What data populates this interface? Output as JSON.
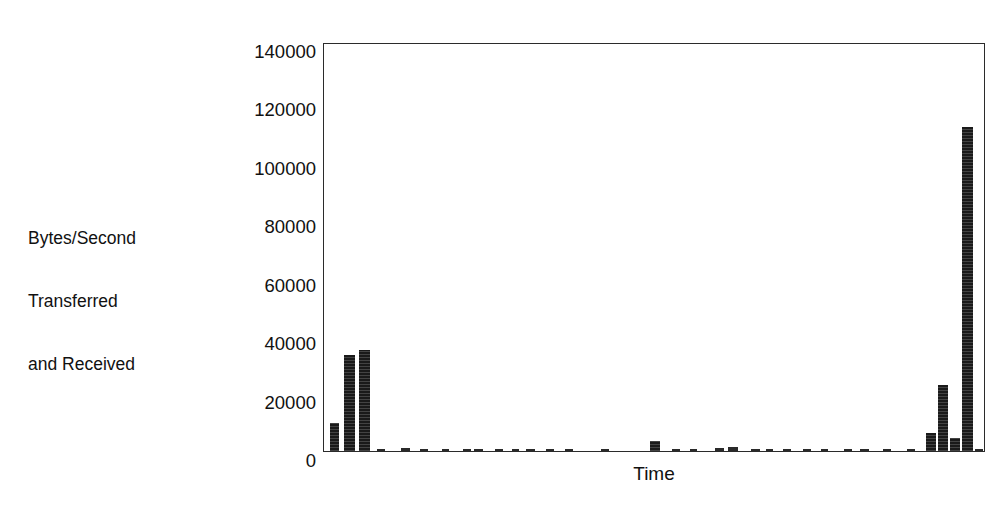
{
  "chart_data": {
    "type": "bar",
    "title": "",
    "subtitle": "",
    "xlabel": "Time",
    "ylabel": "Bytes/Second Transferred and Received",
    "ylabel_lines": [
      "Bytes/Second",
      "Transferred",
      "and Received"
    ],
    "ylim": [
      0,
      140000
    ],
    "xlim": [
      0,
      100
    ],
    "ytick_labels": [
      "0",
      "20000",
      "40000",
      "60000",
      "80000",
      "100000",
      "120000",
      "140000"
    ],
    "ytick_values": [
      0,
      20000,
      40000,
      60000,
      80000,
      100000,
      120000,
      140000
    ],
    "xtick_labels": [],
    "grid": false,
    "legend": false,
    "legend_position": "none",
    "bar_color": "#1a1a1a",
    "axis_color": "#2b2b2b",
    "background_color": "#ffffff",
    "x_unit": "percent-of-axis",
    "categories": [
      "t1",
      "t2",
      "t3",
      "t4",
      "t5",
      "t6",
      "t7",
      "t8",
      "t9",
      "t10",
      "t11",
      "t12",
      "t13",
      "t14",
      "t15",
      "t16",
      "t17",
      "t18",
      "t19",
      "t20",
      "t21",
      "t22",
      "t23",
      "t24",
      "t25",
      "t26",
      "t27",
      "t28",
      "t29",
      "t30",
      "t31",
      "t32",
      "t33",
      "t34"
    ],
    "values": [
      9500,
      33000,
      34500,
      600,
      900,
      500,
      300,
      400,
      700,
      500,
      400,
      600,
      300,
      500,
      400,
      3500,
      600,
      400,
      900,
      1500,
      600,
      400,
      700,
      500,
      300,
      400,
      600,
      500,
      800,
      6000,
      22500,
      4500,
      111000,
      600
    ],
    "bars": [
      {
        "name": "bar-01",
        "x_pct": 0.9,
        "width_pct": 1.35,
        "value": 9500
      },
      {
        "name": "bar-02",
        "x_pct": 3.0,
        "width_pct": 1.65,
        "value": 33000
      },
      {
        "name": "bar-03",
        "x_pct": 5.3,
        "width_pct": 1.65,
        "value": 34500
      },
      {
        "name": "bar-04",
        "x_pct": 8.0,
        "width_pct": 1.2,
        "value": 600
      },
      {
        "name": "bar-05",
        "x_pct": 11.6,
        "width_pct": 1.4,
        "value": 900
      },
      {
        "name": "bar-06",
        "x_pct": 14.5,
        "width_pct": 1.2,
        "value": 500
      },
      {
        "name": "bar-07",
        "x_pct": 17.8,
        "width_pct": 1.1,
        "value": 300
      },
      {
        "name": "bar-08",
        "x_pct": 21.0,
        "width_pct": 1.2,
        "value": 400
      },
      {
        "name": "bar-09",
        "x_pct": 22.7,
        "width_pct": 1.3,
        "value": 700
      },
      {
        "name": "bar-10",
        "x_pct": 25.8,
        "width_pct": 1.2,
        "value": 500
      },
      {
        "name": "bar-11",
        "x_pct": 28.4,
        "width_pct": 1.1,
        "value": 400
      },
      {
        "name": "bar-12",
        "x_pct": 30.5,
        "width_pct": 1.3,
        "value": 600
      },
      {
        "name": "bar-13",
        "x_pct": 33.6,
        "width_pct": 1.1,
        "value": 300
      },
      {
        "name": "bar-14",
        "x_pct": 36.4,
        "width_pct": 1.2,
        "value": 500
      },
      {
        "name": "bar-15",
        "x_pct": 41.8,
        "width_pct": 1.2,
        "value": 400
      },
      {
        "name": "bar-16",
        "x_pct": 49.3,
        "width_pct": 1.45,
        "value": 3500
      },
      {
        "name": "bar-17",
        "x_pct": 52.6,
        "width_pct": 1.2,
        "value": 600
      },
      {
        "name": "bar-18",
        "x_pct": 55.3,
        "width_pct": 1.1,
        "value": 400
      },
      {
        "name": "bar-19",
        "x_pct": 59.0,
        "width_pct": 1.4,
        "value": 900
      },
      {
        "name": "bar-20",
        "x_pct": 61.0,
        "width_pct": 1.5,
        "value": 1500
      },
      {
        "name": "bar-21",
        "x_pct": 64.5,
        "width_pct": 1.3,
        "value": 600
      },
      {
        "name": "bar-22",
        "x_pct": 66.8,
        "width_pct": 1.1,
        "value": 400
      },
      {
        "name": "bar-23",
        "x_pct": 69.3,
        "width_pct": 1.3,
        "value": 700
      },
      {
        "name": "bar-24",
        "x_pct": 72.3,
        "width_pct": 1.2,
        "value": 500
      },
      {
        "name": "bar-25",
        "x_pct": 75.0,
        "width_pct": 1.1,
        "value": 300
      },
      {
        "name": "bar-26",
        "x_pct": 78.5,
        "width_pct": 1.2,
        "value": 400
      },
      {
        "name": "bar-27",
        "x_pct": 81.0,
        "width_pct": 1.3,
        "value": 600
      },
      {
        "name": "bar-28",
        "x_pct": 84.5,
        "width_pct": 1.2,
        "value": 500
      },
      {
        "name": "bar-29",
        "x_pct": 88.0,
        "width_pct": 1.35,
        "value": 800
      },
      {
        "name": "bar-30",
        "x_pct": 90.9,
        "width_pct": 1.5,
        "value": 6000
      },
      {
        "name": "bar-31",
        "x_pct": 92.7,
        "width_pct": 1.6,
        "value": 22500
      },
      {
        "name": "bar-32",
        "x_pct": 94.5,
        "width_pct": 1.5,
        "value": 4500
      },
      {
        "name": "bar-33",
        "x_pct": 96.4,
        "width_pct": 1.6,
        "value": 111000
      },
      {
        "name": "bar-34",
        "x_pct": 98.4,
        "width_pct": 1.1,
        "value": 600
      }
    ]
  }
}
